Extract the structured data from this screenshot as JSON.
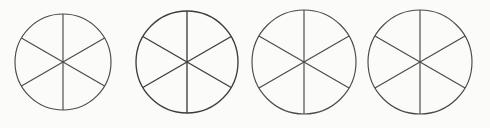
{
  "figure": {
    "name": "six-sector-circles",
    "count": 4,
    "background_color": "#fbfbfa",
    "stroke_color": "#4a4a4a",
    "canvas": {
      "width": 490,
      "height": 128
    }
  },
  "chart_data": {
    "type": "pie",
    "title": "",
    "subtitle": "",
    "xlabel": "",
    "ylabel": "",
    "legend": [],
    "annotations": [],
    "grid": false,
    "note": "Four identical pie/fraction diagrams; each circle is partitioned into 6 congruent unshaded sectors of 60 degrees by 3 full diameters.",
    "sector_count": 6,
    "sector_angle_degrees": 60,
    "slice_fraction": "1/6",
    "values": [
      1,
      1,
      1,
      1,
      1,
      1
    ],
    "categories": [
      "1",
      "2",
      "3",
      "4",
      "5",
      "6"
    ],
    "shaded_sectors": 0,
    "divider_angles_degrees": [
      90,
      30,
      150
    ],
    "series": [
      {
        "name": "circle-1",
        "center_x": 63,
        "center_y": 62,
        "radius": 48,
        "sectors": 6,
        "shaded": 0,
        "values": [
          1,
          1,
          1,
          1,
          1,
          1
        ]
      },
      {
        "name": "circle-2",
        "center_x": 187,
        "center_y": 62,
        "radius": 51,
        "sectors": 6,
        "shaded": 0,
        "values": [
          1,
          1,
          1,
          1,
          1,
          1
        ]
      },
      {
        "name": "circle-3",
        "center_x": 304,
        "center_y": 62,
        "radius": 52,
        "sectors": 6,
        "shaded": 0,
        "values": [
          1,
          1,
          1,
          1,
          1,
          1
        ]
      },
      {
        "name": "circle-4",
        "center_x": 420,
        "center_y": 62,
        "radius": 52,
        "sectors": 6,
        "shaded": 0,
        "values": [
          1,
          1,
          1,
          1,
          1,
          1
        ]
      }
    ]
  },
  "circles": [
    {
      "label": "circle-1",
      "cx": 63,
      "cy": 62,
      "r": 48,
      "ink": "normal"
    },
    {
      "label": "circle-2",
      "cx": 187,
      "cy": 62,
      "r": 51,
      "ink": "heavy"
    },
    {
      "label": "circle-3",
      "cx": 304,
      "cy": 62,
      "r": 52,
      "ink": "normal"
    },
    {
      "label": "circle-4",
      "cx": 420,
      "cy": 62,
      "r": 52,
      "ink": "normal"
    }
  ],
  "background_marks": [
    {
      "text": " ",
      "x": 6,
      "y": 2
    },
    {
      "text": " ",
      "x": 150,
      "y": 3
    },
    {
      "text": " ",
      "x": 300,
      "y": 2
    },
    {
      "text": " ",
      "x": 20,
      "y": 118
    },
    {
      "text": " ",
      "x": 250,
      "y": 119
    }
  ]
}
